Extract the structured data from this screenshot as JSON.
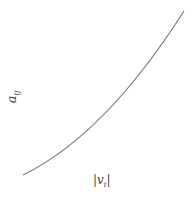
{
  "diagram": {
    "ylabel": {
      "base": "a",
      "sub": "ij"
    },
    "xlabel": {
      "left": "|",
      "base": "v",
      "sub": "i",
      "right": "|"
    },
    "curve": {
      "color": "#777777",
      "start": [
        23,
        175
      ],
      "end": [
        184,
        11
      ],
      "shape": "convex increasing"
    }
  }
}
